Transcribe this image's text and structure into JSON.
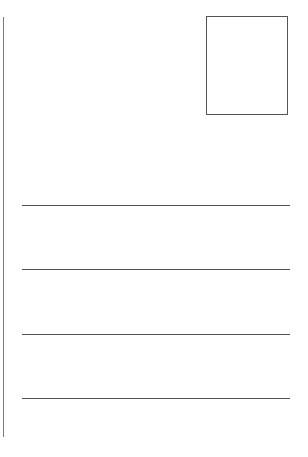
{
  "postcard": {
    "stamp_box": {
      "label": ""
    },
    "address_lines": [
      {
        "value": "",
        "top": 205
      },
      {
        "value": "",
        "top": 269
      },
      {
        "value": "",
        "top": 334
      },
      {
        "value": "",
        "top": 398
      }
    ],
    "colors": {
      "background": "#ffffff",
      "line": "#555555",
      "divider": "#7a7a7a"
    }
  }
}
